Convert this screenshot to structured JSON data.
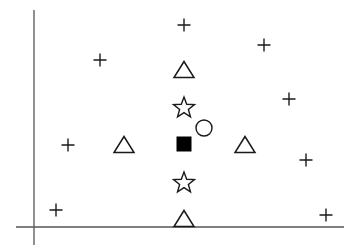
{
  "diagram": {
    "colors": {
      "stroke": "#1a1a1a",
      "axis": "#555555",
      "fill": "#000000",
      "background": "#ffffff"
    },
    "axes": {
      "origin_px": [
        34,
        227
      ],
      "y_axis": {
        "x": 34,
        "y_top": 10,
        "y_bottom": 245
      },
      "x_axis": {
        "y": 227,
        "x_left": 16,
        "x_right": 344
      },
      "labels": "none"
    },
    "markers": {
      "plus": [
        {
          "x": 184,
          "y": 25
        },
        {
          "x": 100,
          "y": 60
        },
        {
          "x": 264,
          "y": 45
        },
        {
          "x": 289,
          "y": 99
        },
        {
          "x": 68,
          "y": 145
        },
        {
          "x": 306,
          "y": 160
        },
        {
          "x": 56,
          "y": 210
        },
        {
          "x": 326,
          "y": 215
        }
      ],
      "triangle": [
        {
          "x": 184,
          "y": 70
        },
        {
          "x": 124,
          "y": 145
        },
        {
          "x": 245,
          "y": 145
        },
        {
          "x": 184,
          "y": 219
        }
      ],
      "star": [
        {
          "x": 184,
          "y": 107
        },
        {
          "x": 184,
          "y": 182
        }
      ],
      "filled_square": [
        {
          "x": 184,
          "y": 144
        }
      ],
      "circle": [
        {
          "x": 204,
          "y": 128
        }
      ]
    }
  }
}
